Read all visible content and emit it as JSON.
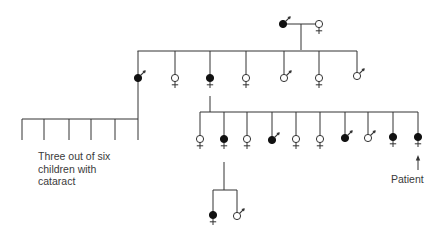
{
  "diagram": {
    "type": "pedigree",
    "colors": {
      "line": "#333333",
      "affected_fill": "#111111",
      "unaffected_fill": "#ffffff"
    },
    "legend_note": {
      "line1": "Three out of six",
      "line2": "children with",
      "line3": "cataract"
    },
    "proband_label": "Patient",
    "generations": [
      {
        "id": "I",
        "members": [
          {
            "sex": "male",
            "affected": true
          },
          {
            "sex": "female",
            "affected": false
          }
        ]
      },
      {
        "id": "II",
        "members": [
          {
            "sex": "male",
            "affected": true
          },
          {
            "sex": "female",
            "affected": false
          },
          {
            "sex": "female",
            "affected": true
          },
          {
            "sex": "female",
            "affected": false
          },
          {
            "sex": "male",
            "affected": false
          },
          {
            "sex": "female",
            "affected": false
          },
          {
            "sex": "male",
            "affected": false
          }
        ]
      },
      {
        "id": "III-left",
        "parent": "II-1",
        "count": 6,
        "affected_count": 3,
        "sex_unspecified": true
      },
      {
        "id": "III",
        "parent": "II-3",
        "members": [
          {
            "sex": "female",
            "affected": false
          },
          {
            "sex": "female",
            "affected": true
          },
          {
            "sex": "female",
            "affected": false
          },
          {
            "sex": "male",
            "affected": true
          },
          {
            "sex": "female",
            "affected": false
          },
          {
            "sex": "female",
            "affected": false
          },
          {
            "sex": "male",
            "affected": true
          },
          {
            "sex": "male",
            "affected": false
          },
          {
            "sex": "female",
            "affected": true
          },
          {
            "sex": "female",
            "affected": true,
            "proband": true
          }
        ]
      },
      {
        "id": "IV",
        "parent": "III-2",
        "members": [
          {
            "sex": "female",
            "affected": true
          },
          {
            "sex": "male",
            "affected": false
          }
        ]
      }
    ]
  }
}
